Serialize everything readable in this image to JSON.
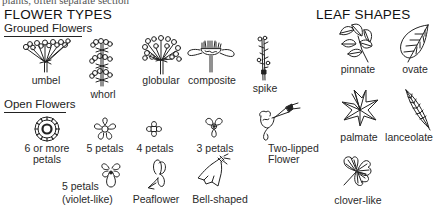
{
  "page": {
    "cropped_top_line": "plants, often separate section"
  },
  "flower_types": {
    "title": "FLOWER TYPES",
    "grouped": {
      "heading": "Grouped Flowers",
      "items": [
        {
          "label": "umbel",
          "icon": "umbel-icon"
        },
        {
          "label": "whorl",
          "icon": "whorl-icon"
        },
        {
          "label": "globular",
          "icon": "globular-icon"
        },
        {
          "label": "composite",
          "icon": "composite-icon"
        },
        {
          "label": "spike",
          "icon": "spike-icon"
        }
      ]
    },
    "open": {
      "heading": "Open Flowers",
      "items": [
        {
          "label_line1": "6 or more",
          "label_line2": "petals",
          "icon": "six-petals-icon"
        },
        {
          "label": "5 petals",
          "icon": "five-petals-icon"
        },
        {
          "label": "4 petals",
          "icon": "four-petals-icon"
        },
        {
          "label": "3 petals",
          "icon": "three-petals-icon"
        },
        {
          "label_line1": "Two-lipped",
          "label_line2": "Flower",
          "icon": "two-lipped-icon"
        },
        {
          "label_line1": "5 petals",
          "label_line2": "(violet-like)",
          "icon": "violet-icon"
        },
        {
          "label": "Peaflower",
          "icon": "peaflower-icon"
        },
        {
          "label": "Bell-shaped",
          "icon": "bell-icon"
        }
      ]
    }
  },
  "leaf_shapes": {
    "title": "LEAF SHAPES",
    "items": [
      {
        "label": "pinnate",
        "icon": "pinnate-leaf-icon"
      },
      {
        "label": "ovate",
        "icon": "ovate-leaf-icon"
      },
      {
        "label": "palmate",
        "icon": "palmate-leaf-icon"
      },
      {
        "label": "lanceolate",
        "icon": "lanceolate-leaf-icon"
      },
      {
        "label": "clover-like",
        "icon": "clover-leaf-icon"
      }
    ]
  }
}
